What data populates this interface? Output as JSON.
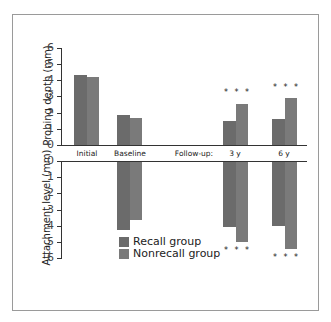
{
  "chart_data": [
    {
      "type": "bar",
      "title": "",
      "ylabel": "Probing depth (mm)",
      "xlabel": "",
      "ylim": [
        0,
        6
      ],
      "yticks": [
        0,
        1,
        2,
        3,
        4,
        5,
        6
      ],
      "categories": [
        "Initial",
        "Baseline",
        "3 y",
        "6 y"
      ],
      "category_prefix": "Follow-up:",
      "series": [
        {
          "name": "Recall group",
          "color": "#6b6b6b",
          "values": [
            4.3,
            1.85,
            1.5,
            1.6
          ]
        },
        {
          "name": "Nonrecall group",
          "color": "#7a7a7a",
          "values": [
            4.2,
            1.7,
            2.55,
            2.9
          ]
        }
      ],
      "annotations": [
        {
          "category": "3 y",
          "text": "* * *"
        },
        {
          "category": "6 y",
          "text": "* * *"
        }
      ],
      "grid": false
    },
    {
      "type": "bar",
      "title": "",
      "ylabel": "Attachment level (mm)",
      "xlabel": "",
      "ylim": [
        0,
        6
      ],
      "yticks": [
        0,
        1,
        2,
        3,
        4,
        5,
        6
      ],
      "inverted": true,
      "categories": [
        "Initial",
        "Baseline",
        "3 y",
        "6 y"
      ],
      "series": [
        {
          "name": "Recall group",
          "color": "#6b6b6b",
          "values": [
            null,
            4.2,
            4.0,
            3.95
          ]
        },
        {
          "name": "Nonrecall group",
          "color": "#7a7a7a",
          "values": [
            null,
            3.6,
            4.95,
            5.4
          ]
        }
      ],
      "annotations": [
        {
          "category": "3 y",
          "text": "* * *"
        },
        {
          "category": "6 y",
          "text": "* * *"
        }
      ],
      "legend": {
        "position": "lower center",
        "entries": [
          "Recall group",
          "Nonrecall group"
        ]
      },
      "grid": false
    }
  ],
  "labels": {
    "top_ylabel": "Probing depth (mm)",
    "bottom_ylabel": "Attachment level (mm)",
    "followup": "Follow-up:",
    "cats": [
      "Initial",
      "Baseline",
      "3 y",
      "6 y"
    ],
    "stars": "***",
    "top_ticks": [
      "6",
      "5",
      "4",
      "3",
      "2",
      "1",
      "0"
    ],
    "bottom_ticks": [
      "0",
      "1",
      "2",
      "3",
      "4",
      "5",
      "6"
    ],
    "legend": [
      "Recall group",
      "Nonrecall group"
    ]
  },
  "colors": {
    "recall": "#6b6b6b",
    "nonrecall": "#7a7a7a",
    "axis": "#333333",
    "frame": "#9a9a9a"
  }
}
